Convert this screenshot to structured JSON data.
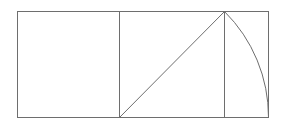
{
  "diagram": {
    "stroke_color": "#6e6e6e",
    "background": "#ffffff",
    "points": {
      "top_left": [
        17,
        11
      ],
      "bottom_left": [
        17,
        117
      ],
      "square_bottom_right": [
        119,
        117
      ],
      "square_top_right": [
        119,
        11
      ],
      "apex": [
        224,
        11
      ],
      "apex_bottom": [
        224,
        117
      ],
      "top_right": [
        268,
        11
      ],
      "bottom_right": [
        268,
        117
      ]
    },
    "elements": [
      {
        "name": "square",
        "type": "rect"
      },
      {
        "name": "outer-rectangle",
        "type": "rect"
      },
      {
        "name": "diagonal",
        "type": "line"
      },
      {
        "name": "apex-vertical",
        "type": "line"
      },
      {
        "name": "arc",
        "type": "arc",
        "center": [
          119,
          117
        ],
        "radius": 149
      }
    ]
  }
}
